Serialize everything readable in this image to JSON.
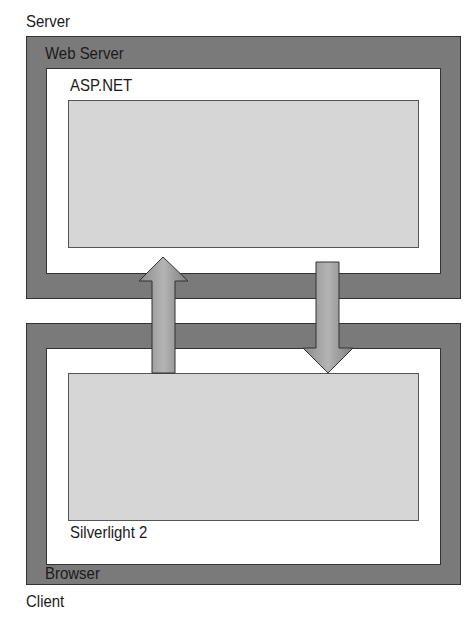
{
  "diagram": {
    "server": {
      "label": "Server",
      "container_label": "Web Server",
      "app_label": "ASP.NET"
    },
    "client": {
      "label": "Client",
      "container_label": "Browser",
      "app_label": "Silverlight 2"
    },
    "arrows": [
      {
        "direction": "up",
        "from": "Silverlight 2",
        "to": "ASP.NET"
      },
      {
        "direction": "down",
        "from": "ASP.NET",
        "to": "Silverlight 2"
      }
    ],
    "colors": {
      "outer_frame": "#7a7a7a",
      "inner_frame": "#ffffff",
      "app_box": "#d6d6d6",
      "arrow_fill": "#9a9a9a",
      "border": "#333333"
    }
  }
}
